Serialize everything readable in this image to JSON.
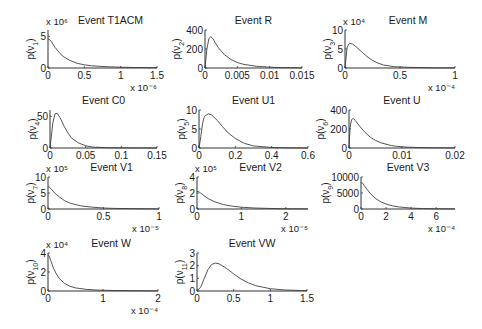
{
  "figure": {
    "width": 482,
    "height": 329,
    "line_color": "#555555",
    "axis_color": "#333333"
  },
  "chart_data": [
    {
      "type": "line",
      "title": "Event T1ACM",
      "ylabel": "p(ν₁)",
      "ysub": "1",
      "xlim": [
        0,
        1.5
      ],
      "ylim": [
        0,
        6
      ],
      "xticks": [
        0,
        0.5,
        1,
        1.5
      ],
      "xticklabels": [
        "0",
        "0.5",
        "1",
        "1.5"
      ],
      "yticks": [
        0,
        5
      ],
      "yticklabels": [
        "0",
        "5"
      ],
      "x_multiplier": "x 10⁻⁶",
      "y_multiplier": "x 10⁶",
      "box": {
        "x": 48,
        "y": 30,
        "w": 109,
        "h": 38
      },
      "x": [
        0,
        0.02,
        0.05,
        0.1,
        0.15,
        0.2,
        0.3,
        0.4,
        0.5,
        0.6,
        0.8,
        1.0,
        1.2,
        1.5
      ],
      "y": [
        4.6,
        4.5,
        4.1,
        3.2,
        2.5,
        1.9,
        1.2,
        0.75,
        0.5,
        0.35,
        0.2,
        0.12,
        0.08,
        0.04
      ]
    },
    {
      "type": "line",
      "title": "Event R",
      "ylabel": "p(ν₂)",
      "ysub": "2",
      "xlim": [
        0,
        0.015
      ],
      "ylim": [
        0,
        400
      ],
      "xticks": [
        0,
        0.005,
        0.01,
        0.015
      ],
      "xticklabels": [
        "0",
        "0.005",
        "0.01",
        "0.015"
      ],
      "yticks": [
        0,
        200,
        400
      ],
      "yticklabels": [
        "0",
        "200",
        "400"
      ],
      "x_multiplier": "",
      "y_multiplier": "",
      "box": {
        "x": 205,
        "y": 30,
        "w": 97,
        "h": 38
      },
      "x": [
        0,
        0.0003,
        0.0006,
        0.0009,
        0.0012,
        0.0016,
        0.002,
        0.003,
        0.004,
        0.005,
        0.006,
        0.008,
        0.01,
        0.012,
        0.015
      ],
      "y": [
        0,
        200,
        310,
        330,
        310,
        265,
        220,
        140,
        90,
        58,
        38,
        18,
        8,
        4,
        2
      ]
    },
    {
      "type": "line",
      "title": "Event M",
      "ylabel": "p(ν₃)",
      "ysub": "3",
      "xlim": [
        0,
        1
      ],
      "ylim": [
        0,
        10
      ],
      "xticks": [
        0,
        0.5,
        1
      ],
      "xticklabels": [
        "0",
        "0.5",
        "1"
      ],
      "yticks": [
        0,
        5,
        10
      ],
      "yticklabels": [
        "0",
        "5",
        "10"
      ],
      "x_multiplier": "x 10⁻⁴",
      "y_multiplier": "x 10⁴",
      "box": {
        "x": 345,
        "y": 30,
        "w": 110,
        "h": 38
      },
      "x": [
        0,
        0.02,
        0.04,
        0.07,
        0.1,
        0.15,
        0.2,
        0.25,
        0.3,
        0.35,
        0.45,
        0.6,
        0.8,
        1.0
      ],
      "y": [
        0,
        5.5,
        6.5,
        6.3,
        5.6,
        4.3,
        3.0,
        2.0,
        1.3,
        0.8,
        0.35,
        0.15,
        0.05,
        0.02
      ]
    },
    {
      "type": "line",
      "title": "Event C0",
      "ylabel": "p(ν₄)",
      "ysub": "4",
      "xlim": [
        0,
        0.15
      ],
      "ylim": [
        0,
        60
      ],
      "xticks": [
        0,
        0.05,
        0.1,
        0.15
      ],
      "xticklabels": [
        "0",
        "0.05",
        "0.1",
        "0.15"
      ],
      "yticks": [
        0,
        50
      ],
      "yticklabels": [
        "0",
        "50"
      ],
      "x_multiplier": "",
      "y_multiplier": "",
      "box": {
        "x": 50,
        "y": 110,
        "w": 107,
        "h": 38
      },
      "x": [
        0,
        0.004,
        0.007,
        0.01,
        0.014,
        0.02,
        0.025,
        0.03,
        0.04,
        0.05,
        0.06,
        0.08,
        0.1,
        0.15
      ],
      "y": [
        0,
        40,
        54,
        55,
        48,
        34,
        24,
        16,
        8,
        3.5,
        1.5,
        0.5,
        0.2,
        0.05
      ]
    },
    {
      "type": "line",
      "title": "Event U1",
      "ylabel": "p(ν₅)",
      "ysub": "5",
      "xlim": [
        0,
        0.6
      ],
      "ylim": [
        0,
        10
      ],
      "xticks": [
        0,
        0.2,
        0.4,
        0.6
      ],
      "xticklabels": [
        "0",
        "0.2",
        "0.4",
        "0.6"
      ],
      "yticks": [
        0,
        5,
        10
      ],
      "yticklabels": [
        "0",
        "5",
        "10"
      ],
      "x_multiplier": "",
      "y_multiplier": "",
      "box": {
        "x": 199,
        "y": 110,
        "w": 109,
        "h": 38
      },
      "x": [
        0,
        0.01,
        0.02,
        0.03,
        0.05,
        0.07,
        0.1,
        0.13,
        0.16,
        0.2,
        0.25,
        0.3,
        0.4,
        0.5,
        0.6
      ],
      "y": [
        0,
        3,
        6.5,
        8.3,
        9.0,
        8.7,
        7.3,
        5.6,
        4.0,
        2.5,
        1.2,
        0.55,
        0.12,
        0.03,
        0.01
      ]
    },
    {
      "type": "line",
      "title": "Event U",
      "ylabel": "p(ν₆)",
      "ysub": "6",
      "xlim": [
        0,
        0.02
      ],
      "ylim": [
        0,
        400
      ],
      "xticks": [
        0,
        0.01,
        0.02
      ],
      "xticklabels": [
        "0",
        "0.01",
        "0.02"
      ],
      "yticks": [
        0,
        200,
        400
      ],
      "yticklabels": [
        "0",
        "200",
        "400"
      ],
      "x_multiplier": "",
      "y_multiplier": "",
      "box": {
        "x": 349,
        "y": 110,
        "w": 106,
        "h": 38
      },
      "x": [
        0,
        0.0002,
        0.0005,
        0.0008,
        0.0012,
        0.002,
        0.003,
        0.004,
        0.005,
        0.006,
        0.008,
        0.01,
        0.013,
        0.016,
        0.02
      ],
      "y": [
        0,
        220,
        300,
        310,
        290,
        230,
        165,
        115,
        80,
        55,
        25,
        12,
        5,
        2,
        1
      ]
    },
    {
      "type": "line",
      "title": "Event V1",
      "ylabel": "p(ν₇)",
      "ysub": "7",
      "xlim": [
        0,
        1
      ],
      "ylim": [
        0,
        10
      ],
      "xticks": [
        0,
        0.5,
        1
      ],
      "xticklabels": [
        "0",
        "0.5",
        "1"
      ],
      "yticks": [
        0,
        5,
        10
      ],
      "yticklabels": [
        "0",
        "5",
        "10"
      ],
      "x_multiplier": "x 10⁻⁵",
      "y_multiplier": "x 10⁵",
      "box": {
        "x": 48,
        "y": 177,
        "w": 111,
        "h": 32
      },
      "x": [
        0,
        0.01,
        0.03,
        0.06,
        0.1,
        0.15,
        0.2,
        0.3,
        0.4,
        0.5,
        0.6,
        0.8,
        1.0
      ],
      "y": [
        7.0,
        6.9,
        6.2,
        5.0,
        3.8,
        2.6,
        1.8,
        0.95,
        0.55,
        0.32,
        0.2,
        0.08,
        0.04
      ]
    },
    {
      "type": "line",
      "title": "Event V2",
      "ylabel": "p(ν₈)",
      "ysub": "8",
      "xlim": [
        0,
        2.5
      ],
      "ylim": [
        0,
        4
      ],
      "xticks": [
        0,
        1,
        2
      ],
      "xticklabels": [
        "0",
        "1",
        "2"
      ],
      "yticks": [
        0,
        2,
        4
      ],
      "yticklabels": [
        "0",
        "2",
        "4"
      ],
      "x_multiplier": "x 10⁻⁵",
      "y_multiplier": "x 10⁵",
      "box": {
        "x": 197,
        "y": 177,
        "w": 111,
        "h": 32
      },
      "x": [
        0,
        0.03,
        0.08,
        0.15,
        0.25,
        0.4,
        0.6,
        0.8,
        1.0,
        1.3,
        1.6,
        2.0,
        2.5
      ],
      "y": [
        2.2,
        2.2,
        2.0,
        1.7,
        1.3,
        0.9,
        0.55,
        0.35,
        0.22,
        0.12,
        0.07,
        0.03,
        0.015
      ]
    },
    {
      "type": "line",
      "title": "Event V3",
      "ylabel": "p(ν₉)",
      "ysub": "9",
      "xlim": [
        0,
        7.5
      ],
      "ylim": [
        0,
        10000
      ],
      "xticks": [
        0,
        2,
        4,
        6
      ],
      "xticklabels": [
        "0",
        "2",
        "4",
        "6"
      ],
      "yticks": [
        0,
        5000,
        10000
      ],
      "yticklabels": [
        "0",
        "5000",
        "10000"
      ],
      "x_multiplier": "x 10⁻⁴",
      "y_multiplier": "",
      "box": {
        "x": 361,
        "y": 177,
        "w": 94,
        "h": 32
      },
      "x": [
        0,
        0.1,
        0.25,
        0.5,
        0.8,
        1.2,
        1.6,
        2.0,
        2.5,
        3.0,
        4.0,
        5.0,
        6.0,
        7.5
      ],
      "y": [
        8300,
        8200,
        7400,
        6000,
        4600,
        3200,
        2200,
        1550,
        1000,
        650,
        280,
        120,
        55,
        20
      ]
    },
    {
      "type": "line",
      "title": "Event W",
      "ylabel": "p(ν₁₀)",
      "ysub": "10",
      "xlim": [
        0,
        2
      ],
      "ylim": [
        0,
        4
      ],
      "xticks": [
        0,
        1,
        2
      ],
      "xticklabels": [
        "0",
        "1",
        "2"
      ],
      "yticks": [
        0,
        2,
        4
      ],
      "yticklabels": [
        "0",
        "2",
        "4"
      ],
      "x_multiplier": "x 10⁻⁴",
      "y_multiplier": "x 10⁴",
      "box": {
        "x": 48,
        "y": 253,
        "w": 110,
        "h": 38
      },
      "x": [
        0,
        0.02,
        0.05,
        0.1,
        0.15,
        0.2,
        0.3,
        0.4,
        0.5,
        0.7,
        0.9,
        1.2,
        1.5,
        2.0
      ],
      "y": [
        3.8,
        3.7,
        3.2,
        2.4,
        1.8,
        1.35,
        0.8,
        0.5,
        0.33,
        0.17,
        0.1,
        0.05,
        0.03,
        0.015
      ]
    },
    {
      "type": "line",
      "title": "Event VW",
      "ylabel": "p(ν₁₁)",
      "ysub": "11",
      "xlim": [
        0,
        1.5
      ],
      "ylim": [
        0,
        3
      ],
      "xticks": [
        0,
        0.5,
        1,
        1.5
      ],
      "xticklabels": [
        "0",
        "0.5",
        "1",
        "1.5"
      ],
      "yticks": [
        0,
        1,
        2,
        3
      ],
      "yticklabels": [
        "0",
        "1",
        "2",
        "3"
      ],
      "x_multiplier": "",
      "y_multiplier": "",
      "box": {
        "x": 197,
        "y": 253,
        "w": 110,
        "h": 38
      },
      "x": [
        0,
        0.05,
        0.1,
        0.15,
        0.2,
        0.25,
        0.3,
        0.4,
        0.5,
        0.6,
        0.7,
        0.8,
        1.0,
        1.2,
        1.5
      ],
      "y": [
        0,
        0.3,
        1.0,
        1.7,
        2.1,
        2.2,
        2.15,
        1.8,
        1.35,
        0.95,
        0.65,
        0.42,
        0.18,
        0.08,
        0.02
      ]
    }
  ]
}
